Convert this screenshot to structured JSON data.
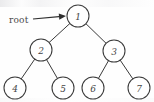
{
  "figure": {
    "root_pointer_label": "root",
    "background_color": "#fefefe",
    "stroke_color": "#3b3b3b",
    "label_color": "#454545"
  },
  "chart_data": {
    "type": "diagram",
    "diagram_kind": "binary-tree",
    "annotations": [
      {
        "text": "root",
        "x": 9,
        "y": 20,
        "points_to": "1",
        "arrow_from": [
          33,
          19
        ],
        "arrow_to": [
          66,
          16
        ]
      }
    ],
    "node_radius": 11,
    "levels": 3,
    "nodes": [
      {
        "id": "1",
        "label": "1",
        "x": 78,
        "y": 16,
        "level": 0,
        "parent": null
      },
      {
        "id": "2",
        "label": "2",
        "x": 41,
        "y": 50,
        "level": 1,
        "parent": "1"
      },
      {
        "id": "3",
        "label": "3",
        "x": 114,
        "y": 51,
        "level": 1,
        "parent": "1"
      },
      {
        "id": "4",
        "label": "4",
        "x": 15,
        "y": 88,
        "level": 2,
        "parent": "2"
      },
      {
        "id": "5",
        "label": "5",
        "x": 63,
        "y": 88,
        "level": 2,
        "parent": "2"
      },
      {
        "id": "6",
        "label": "6",
        "x": 93,
        "y": 88,
        "level": 2,
        "parent": "3"
      },
      {
        "id": "7",
        "label": "7",
        "x": 139,
        "y": 88,
        "level": 2,
        "parent": "3"
      }
    ],
    "edges": [
      {
        "from": "1",
        "to": "2"
      },
      {
        "from": "1",
        "to": "3"
      },
      {
        "from": "2",
        "to": "4"
      },
      {
        "from": "2",
        "to": "5"
      },
      {
        "from": "3",
        "to": "6"
      },
      {
        "from": "3",
        "to": "7"
      }
    ]
  }
}
